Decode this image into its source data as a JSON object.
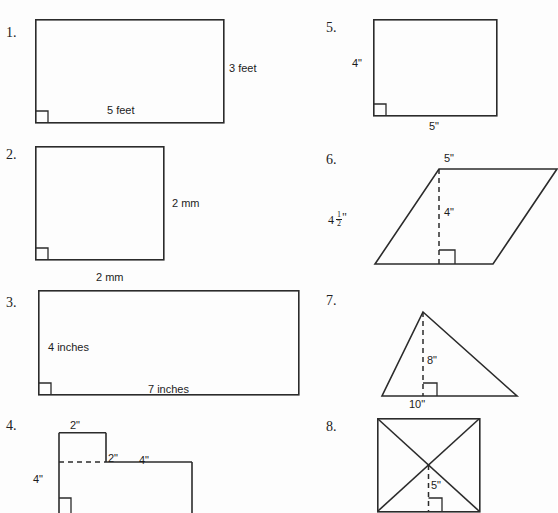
{
  "worksheet": {
    "background_color": "#fdfdfd",
    "ink_color": "#2b2b2b"
  },
  "problems": [
    {
      "number": "1.",
      "shape": "rectangle",
      "labels": {
        "right": "3 feet",
        "bottom": "5 feet"
      },
      "has_right_angle_marker": true
    },
    {
      "number": "2.",
      "shape": "square",
      "labels": {
        "right": "2 mm",
        "bottom": "2 mm"
      },
      "has_right_angle_marker": true
    },
    {
      "number": "3.",
      "shape": "rectangle",
      "labels": {
        "left_inside": "4 inches",
        "bottom_inside": "7 inches"
      },
      "has_right_angle_marker": true
    },
    {
      "number": "4.",
      "shape": "compound-l-shape",
      "labels": {
        "top": "2\"",
        "middle_right": "2\"",
        "left": "4\"",
        "upper_right": "4\""
      },
      "has_right_angle_marker": true,
      "has_dashed_divider": true
    },
    {
      "number": "5.",
      "shape": "rectangle",
      "labels": {
        "left": "4\"",
        "bottom": "5\""
      },
      "has_right_angle_marker": true
    },
    {
      "number": "6.",
      "shape": "parallelogram",
      "labels": {
        "top": "5\"",
        "slant_side_whole": "4",
        "slant_side_numerator": "1",
        "slant_side_denominator": "2",
        "slant_side_unit": "\"",
        "height": "4\""
      },
      "has_right_angle_marker": true,
      "has_dashed_height": true
    },
    {
      "number": "7.",
      "shape": "triangle",
      "labels": {
        "height": "8\"",
        "base": "10\""
      },
      "has_right_angle_marker": true,
      "has_dashed_height": true
    },
    {
      "number": "8.",
      "shape": "square-with-diagonals",
      "labels": {
        "height": "5\""
      },
      "has_right_angle_marker": true,
      "has_dashed_height": true,
      "has_diagonals": true
    }
  ]
}
